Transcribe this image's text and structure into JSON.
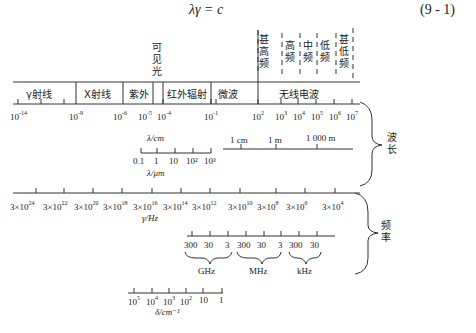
{
  "equation": {
    "text": "λγ = c",
    "number": "(9 - 1)"
  },
  "bands": {
    "regions": [
      "γ射线",
      "X射线",
      "紫外",
      "红外辐射",
      "微波",
      "无线电波"
    ],
    "visible_light": [
      "可",
      "见",
      "光"
    ],
    "radio_subbands": [
      {
        "label": [
          "甚",
          "高",
          "频"
        ]
      },
      {
        "label": [
          "高",
          "频"
        ]
      },
      {
        "label": [
          "中",
          "频"
        ]
      },
      {
        "label": [
          "低",
          "频"
        ]
      },
      {
        "label": [
          "甚",
          "低",
          "频"
        ]
      }
    ]
  },
  "wavelength_axis": {
    "ticks": [
      {
        "base": "10",
        "exp": "-14"
      },
      {
        "base": "10",
        "exp": "-9"
      },
      {
        "base": "10",
        "exp": "-6"
      },
      {
        "base": "10",
        "exp": "-5"
      },
      {
        "base": "10",
        "exp": "-4"
      },
      {
        "base": "10",
        "exp": "-1"
      },
      {
        "base": "10",
        "exp": "2"
      },
      {
        "base": "10",
        "exp": "3"
      },
      {
        "base": "10",
        "exp": "4"
      },
      {
        "base": "10",
        "exp": "5"
      },
      {
        "base": "10",
        "exp": "6"
      },
      {
        "base": "10",
        "exp": "7"
      }
    ],
    "unit": "λ/cm",
    "um_scale": {
      "ticks": [
        "0.1",
        "1",
        "10",
        "10²",
        "10³"
      ],
      "unit": "λ/μm"
    },
    "m_scale": {
      "ticks": [
        "1 cm",
        "1 m",
        "1 000 m"
      ]
    },
    "brace_label": [
      "波",
      "长"
    ]
  },
  "frequency_axis": {
    "ticks": [
      {
        "base": "3×10",
        "exp": "24"
      },
      {
        "base": "3×10",
        "exp": "22"
      },
      {
        "base": "3×10",
        "exp": "20"
      },
      {
        "base": "3×10",
        "exp": "18"
      },
      {
        "base": "3×10",
        "exp": "16"
      },
      {
        "base": "3×10",
        "exp": "14"
      },
      {
        "base": "3×10",
        "exp": "12"
      },
      {
        "base": "3×10",
        "exp": "10"
      },
      {
        "base": "3×10",
        "exp": "8"
      },
      {
        "base": "3×10",
        "exp": "6"
      },
      {
        "base": "3×10",
        "exp": "4"
      }
    ],
    "unit": "γ/Hz",
    "sub_scale": {
      "ticks": [
        "300",
        "30",
        "3",
        "300",
        "30",
        "3",
        "300",
        "30"
      ],
      "groups": [
        "GHz",
        "MHz",
        "kHz"
      ]
    },
    "brace_label": [
      "频",
      "率"
    ]
  },
  "wavenumber_axis": {
    "ticks": [
      {
        "base": "10",
        "exp": "5"
      },
      {
        "base": "10",
        "exp": "4"
      },
      {
        "base": "10",
        "exp": "3"
      },
      {
        "base": "10",
        "exp": "2"
      },
      {
        "base": "10",
        "exp": ""
      },
      {
        "base": "1",
        "exp": ""
      }
    ],
    "unit": "δ/cm⁻¹"
  }
}
